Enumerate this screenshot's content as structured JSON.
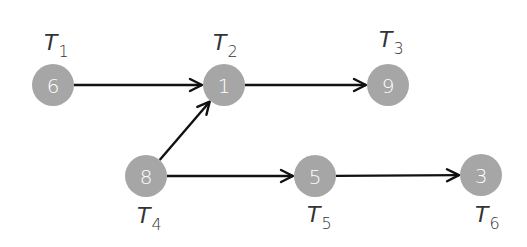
{
  "diagram": {
    "type": "directed task graph",
    "nodes": [
      {
        "id": "T1",
        "label": "T",
        "sub": "1",
        "value": "6",
        "cx": 53,
        "cy": 85,
        "lx": 44,
        "ly": 50
      },
      {
        "id": "T2",
        "label": "T",
        "sub": "2",
        "value": "1",
        "cx": 224,
        "cy": 85,
        "lx": 213,
        "ly": 50
      },
      {
        "id": "T3",
        "label": "T",
        "sub": "3",
        "value": "9",
        "cx": 388,
        "cy": 85,
        "lx": 379,
        "ly": 47
      },
      {
        "id": "T4",
        "label": "T",
        "sub": "4",
        "value": "8",
        "cx": 146,
        "cy": 176,
        "lx": 137,
        "ly": 223
      },
      {
        "id": "T5",
        "label": "T",
        "sub": "5",
        "value": "5",
        "cx": 315,
        "cy": 176,
        "lx": 307,
        "ly": 222
      },
      {
        "id": "T6",
        "label": "T",
        "sub": "6",
        "value": "3",
        "cx": 481,
        "cy": 175,
        "lx": 475,
        "ly": 222
      }
    ],
    "edges": [
      {
        "from": "T1",
        "to": "T2"
      },
      {
        "from": "T2",
        "to": "T3"
      },
      {
        "from": "T4",
        "to": "T2"
      },
      {
        "from": "T4",
        "to": "T5"
      },
      {
        "from": "T5",
        "to": "T6"
      }
    ],
    "colors": {
      "node_fill": "#a6a6a6",
      "node_text": "#ffffff",
      "edge": "#111111",
      "label": "#333333"
    }
  }
}
